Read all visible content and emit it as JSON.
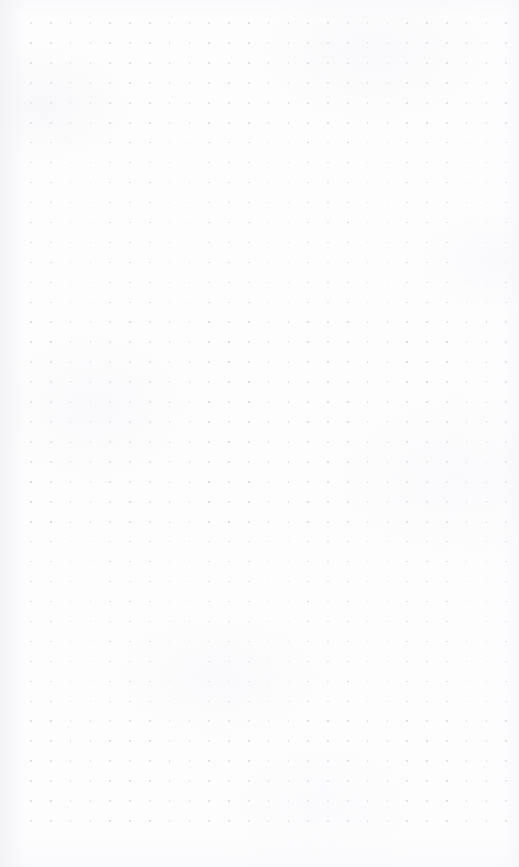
{
  "document": {
    "kind": "dot-grid-paper",
    "title": "",
    "body_text": "",
    "annotations": [],
    "page_width": 519,
    "page_height": 867,
    "background_color": "#fdfdfe"
  },
  "grid": {
    "label": "dot grid",
    "dot_color": "#d6d6dc",
    "dot_diameter_px": 1.6,
    "spacing_x_px": 19.8,
    "spacing_y_px": 19.95,
    "origin_x_px": 31,
    "origin_y_px": 23,
    "columns": 25,
    "rows": 41
  },
  "margins": {
    "left_px": 31,
    "right_px": 13,
    "top_px": 23,
    "bottom_px": 47
  }
}
